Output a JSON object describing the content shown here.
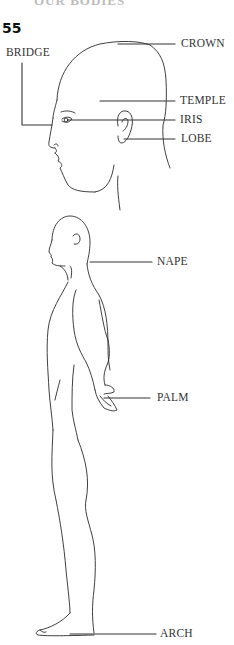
{
  "page": {
    "cut_heading": "OUR BODIES",
    "item_number": "55"
  },
  "head_labels": {
    "crown": "CROWN",
    "bridge": "BRIDGE",
    "temple": "TEMPLE",
    "iris": "IRIS",
    "lobe": "LOBE"
  },
  "body_labels": {
    "nape": "NAPE",
    "palm": "PALM",
    "arch": "ARCH"
  },
  "colors": {
    "background": "#ffffff",
    "line": "#2a2a2a",
    "text": "#333333"
  }
}
